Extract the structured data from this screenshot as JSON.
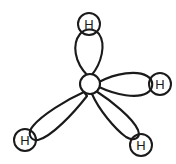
{
  "diagram": {
    "type": "molecular-orbital-diagram",
    "background_color": "#ffffff",
    "stroke_color": "#1a1a1a",
    "fill_color": "#ffffff",
    "central_atom": {
      "name": "central-atom",
      "label": "",
      "cx": 90,
      "cy": 84,
      "r": 10
    },
    "hydrogens": [
      {
        "id": "top",
        "label": "H",
        "cx": 89,
        "cy": 24,
        "r": 11
      },
      {
        "id": "right",
        "label": "H",
        "cx": 160,
        "cy": 84,
        "r": 11
      },
      {
        "id": "bottom-left",
        "label": "H",
        "cx": 25,
        "cy": 140,
        "r": 11
      },
      {
        "id": "bottom-right",
        "label": "H",
        "cx": 141,
        "cy": 145,
        "r": 11
      }
    ],
    "lobes": [
      {
        "id": "lobe-top",
        "direction": "up",
        "path": "M 88 76 C 74 62 72 44 80 34 C 85 28 94 28 99 34 C 106 44 102 63 91 76 Z"
      },
      {
        "id": "lobe-right",
        "direction": "right",
        "path": "M 99 82 C 116 73 137 70 147 76 C 154 80 154 89 147 93 C 137 99 116 95 99 87 Z"
      },
      {
        "id": "lobe-bottom-left",
        "direction": "down-left",
        "path": "M 84 92 C 66 100 42 115 33 126 C 27 133 30 141 38 140 C 51 137 73 114 87 96 Z"
      },
      {
        "id": "lobe-bottom-right",
        "direction": "down-right",
        "path": "M 92 94 C 99 110 115 129 126 137 C 134 142 141 138 138 130 C 133 118 110 100 96 91 Z"
      }
    ]
  }
}
